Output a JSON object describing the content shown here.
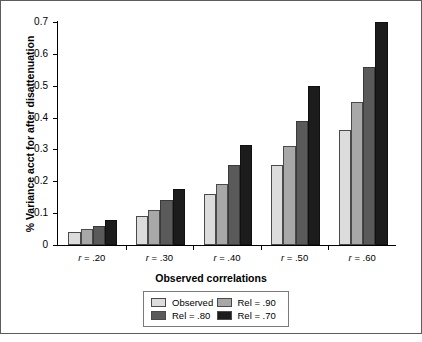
{
  "chart_data": {
    "type": "bar",
    "title": "",
    "xlabel": "Observed correlations",
    "ylabel": "% Variance acct for after disattenuation",
    "categories": [
      "r = .20",
      "r = .30",
      "r = .40",
      "r = .50",
      "r = .60"
    ],
    "series": [
      {
        "name": "Observed",
        "color": "#dcdcdc",
        "values": [
          0.04,
          0.09,
          0.16,
          0.25,
          0.36
        ]
      },
      {
        "name": "Rel = .90",
        "color": "#a8a8a8",
        "values": [
          0.05,
          0.11,
          0.19,
          0.31,
          0.45
        ]
      },
      {
        "name": "Rel = .80",
        "color": "#5a5a5a",
        "values": [
          0.06,
          0.14,
          0.25,
          0.39,
          0.56
        ]
      },
      {
        "name": "Rel = .70",
        "color": "#1c1c1c",
        "values": [
          0.08,
          0.175,
          0.315,
          0.5,
          0.7
        ]
      }
    ],
    "ylim": [
      0,
      0.7
    ],
    "yticks": [
      "0",
      "0.1",
      "0.2",
      "0.3",
      "0.4",
      "0.5",
      "0.6",
      "0.7"
    ],
    "ytick_values": [
      0,
      0.1,
      0.2,
      0.3,
      0.4,
      0.5,
      0.6,
      0.7
    ],
    "grid": false,
    "legend_position": "bottom-center",
    "legend_order": [
      "Observed",
      "Rel = .90",
      "Rel = .80",
      "Rel = .70"
    ]
  }
}
